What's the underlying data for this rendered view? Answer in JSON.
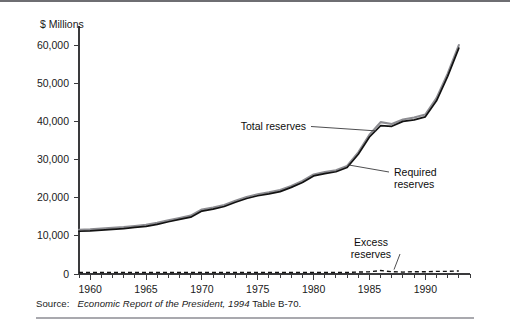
{
  "figure": {
    "y_axis_title": "$ Millions",
    "source_label": "Source:",
    "source_title": "Economic Report of the President, 1994",
    "source_tail": " Table B-70."
  },
  "annotations": [
    {
      "id": "total",
      "line1": "Total reserves",
      "line2": ""
    },
    {
      "id": "required",
      "line1": "Required",
      "line2": "reserves"
    },
    {
      "id": "excess",
      "line1": "Excess",
      "line2": "reserves"
    }
  ],
  "colors": {
    "total_reserves": "#8d8d92",
    "required_reserves": "#121212",
    "excess_reserves": "#121212",
    "axis": "#3a3a3c",
    "frame": "#6e6e72"
  },
  "chart_data": {
    "type": "line",
    "title": "",
    "xlabel": "",
    "ylabel": "$ Millions",
    "xlim": [
      1959,
      1994
    ],
    "ylim": [
      0,
      65000
    ],
    "grid": false,
    "legend": "annotations-on-plot",
    "x_ticks_major": [
      1960,
      1965,
      1970,
      1975,
      1980,
      1985,
      1990
    ],
    "x_tick_labels": [
      "1960",
      "1965",
      "1970",
      "1975",
      "1980",
      "1985",
      "1990"
    ],
    "x_ticks_minor_step": 1,
    "y_ticks": [
      0,
      10000,
      20000,
      30000,
      40000,
      50000,
      60000
    ],
    "y_tick_labels": [
      "0",
      "10,000",
      "20,000",
      "30,000",
      "40,000",
      "50,000",
      "60,000"
    ],
    "x": [
      1959,
      1960,
      1961,
      1962,
      1963,
      1964,
      1965,
      1966,
      1967,
      1968,
      1969,
      1970,
      1971,
      1972,
      1973,
      1974,
      1975,
      1976,
      1977,
      1978,
      1979,
      1980,
      1981,
      1982,
      1983,
      1984,
      1985,
      1986,
      1987,
      1988,
      1989,
      1990,
      1991,
      1992,
      1993
    ],
    "series": [
      {
        "name": "Total reserves",
        "color": "#8d8d92",
        "style": "solid",
        "values": [
          11600,
          11700,
          11900,
          12100,
          12300,
          12600,
          12900,
          13400,
          14100,
          14700,
          15300,
          16900,
          17400,
          18100,
          19200,
          20200,
          20900,
          21400,
          22000,
          23100,
          24400,
          26100,
          26700,
          27200,
          28300,
          31900,
          36500,
          39800,
          39300,
          40500,
          41000,
          41800,
          46100,
          52500,
          60000
        ],
        "unit": "$ Millions"
      },
      {
        "name": "Required reserves",
        "color": "#121212",
        "style": "solid",
        "values": [
          11200,
          11300,
          11500,
          11700,
          11900,
          12200,
          12500,
          13000,
          13700,
          14300,
          14900,
          16500,
          17000,
          17700,
          18800,
          19800,
          20500,
          21000,
          21600,
          22700,
          24000,
          25700,
          26300,
          26800,
          27900,
          31400,
          35900,
          38900,
          38700,
          40000,
          40400,
          41200,
          45400,
          51800,
          59200
        ],
        "unit": "$ Millions"
      },
      {
        "name": "Excess reserves",
        "color": "#121212",
        "style": "dashed",
        "values": [
          400,
          400,
          400,
          400,
          400,
          400,
          400,
          400,
          400,
          400,
          400,
          400,
          400,
          400,
          400,
          400,
          400,
          400,
          400,
          400,
          400,
          400,
          400,
          400,
          400,
          500,
          600,
          900,
          600,
          500,
          600,
          600,
          700,
          700,
          800
        ],
        "unit": "$ Millions"
      }
    ]
  },
  "plot_geometry": {
    "left": 79,
    "right": 470,
    "top": 24,
    "bottom": 272
  }
}
